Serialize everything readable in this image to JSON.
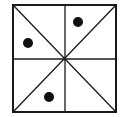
{
  "diagram": {
    "type": "square-grid-puzzle",
    "frame": {
      "x1": 13,
      "y1": 5,
      "x2": 116,
      "y2": 112,
      "stroke": "#1a1a1a",
      "stroke_width": 2
    },
    "lines": [
      {
        "name": "vertical-midline",
        "x1": 65,
        "y1": 5,
        "x2": 65,
        "y2": 112
      },
      {
        "name": "horizontal-midline",
        "x1": 13,
        "y1": 59,
        "x2": 116,
        "y2": 59
      },
      {
        "name": "diagonal-tl-br",
        "x1": 13,
        "y1": 5,
        "x2": 116,
        "y2": 112
      },
      {
        "name": "diagonal-tr-bl",
        "x1": 116,
        "y1": 5,
        "x2": 13,
        "y2": 112
      }
    ],
    "dots": [
      {
        "name": "dot-top-right-upper",
        "cx": 78,
        "cy": 22,
        "r": 5
      },
      {
        "name": "dot-top-left-lower",
        "cx": 28,
        "cy": 43,
        "r": 5
      },
      {
        "name": "dot-bottom-left-lower",
        "cx": 49,
        "cy": 97,
        "r": 5
      }
    ],
    "dot_color": "#111111",
    "line_color": "#1a1a1a",
    "background": "#ffffff"
  }
}
